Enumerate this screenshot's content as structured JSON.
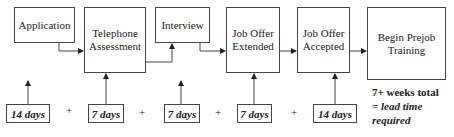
{
  "diagram": {
    "steps": [
      {
        "id": "application",
        "label": "Application"
      },
      {
        "id": "telephone-assessment",
        "label": "Telephone\nAssessment"
      },
      {
        "id": "interview",
        "label": "Interview"
      },
      {
        "id": "job-offer-extended",
        "label": "Job Offer\nExtended"
      },
      {
        "id": "job-offer-accepted",
        "label": "Job Offer\nAccepted"
      },
      {
        "id": "begin-prejob-training",
        "label": "Begin Prejob\nTraining"
      }
    ],
    "durations": [
      {
        "label": "14 days"
      },
      {
        "label": "7 days"
      },
      {
        "label": "7 days"
      },
      {
        "label": "7 days"
      },
      {
        "label": "14 days"
      }
    ],
    "operator": "+",
    "total": {
      "line1": "7+ weeks total",
      "line2": "= lead time",
      "line3": "required"
    },
    "colors": {
      "line": "#444444",
      "background": "#ffffff",
      "text": "#222222"
    }
  }
}
